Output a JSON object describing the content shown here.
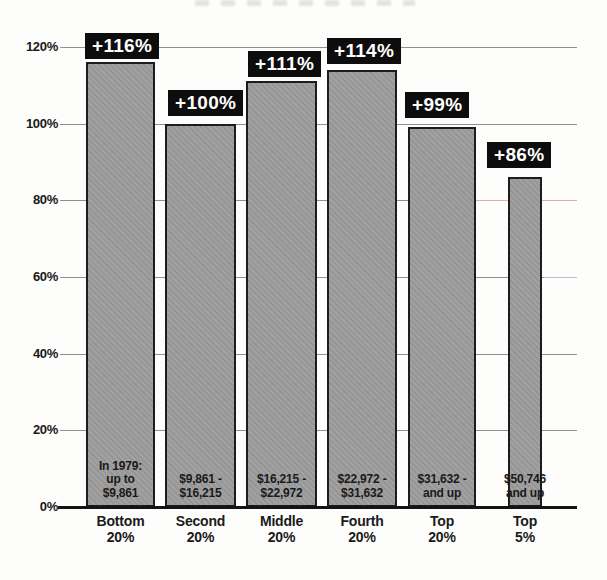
{
  "chart_data": {
    "type": "bar",
    "title": "",
    "xlabel": "",
    "ylabel": "",
    "ylim": [
      0,
      120
    ],
    "ytick_step": 20,
    "grid": true,
    "legend": "none",
    "ytick_labels": [
      "0%",
      "20%",
      "40%",
      "60%",
      "80%",
      "100%",
      "120%"
    ],
    "categories": [
      "Bottom 20%",
      "Second 20%",
      "Middle 20%",
      "Fourth 20%",
      "Top 20%",
      "Top 5%"
    ],
    "bars": [
      {
        "category_label": "Bottom\n20%",
        "value": 116,
        "value_label": "+116%",
        "income_range": "In 1979:\nup to\n$9,861"
      },
      {
        "category_label": "Second\n20%",
        "value": 100,
        "value_label": "+100%",
        "income_range": "$9,861 -\n$16,215"
      },
      {
        "category_label": "Middle\n20%",
        "value": 111,
        "value_label": "+111%",
        "income_range": "$16,215 -\n$22,972"
      },
      {
        "category_label": "Fourth\n20%",
        "value": 114,
        "value_label": "+114%",
        "income_range": "$22,972 -\n$31,632"
      },
      {
        "category_label": "Top\n20%",
        "value": 99,
        "value_label": "+99%",
        "income_range": "$31,632 -\nand up"
      },
      {
        "category_label": "Top\n5%",
        "value": 86,
        "value_label": "+86%",
        "income_range": "$50,746\nand up"
      }
    ],
    "colors": {
      "bar_fill": "#9c9c9c",
      "bar_border": "#1c1c1c",
      "badge_bg": "#0d0d0d",
      "badge_text": "#ffffff",
      "gridline": "#909090",
      "baseline": "#141414",
      "text": "#1a1a1a",
      "scan_artifact_pink": "#dfadad",
      "scan_artifact_blue": "#b9c0da"
    }
  }
}
